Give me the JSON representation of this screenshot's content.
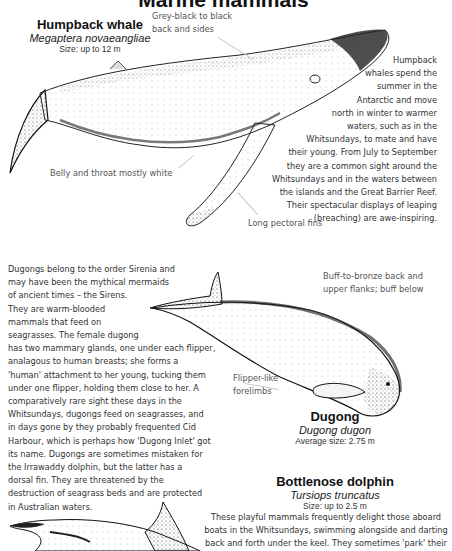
{
  "page": {
    "title": "Marine mammals"
  },
  "humpback": {
    "name": "Humpback whale",
    "scientific": "Megaptera novaeangliae",
    "size": "Size: up to 12 m",
    "labels": {
      "back": [
        "Grey-black to black",
        "back and sides"
      ],
      "belly": "Belly and throat mostly white",
      "fins": "Long pectoral fins"
    },
    "description": [
      "Humpback",
      "whales spend the",
      "summer in the",
      "Antarctic and move",
      "north in winter to warmer",
      "waters, such as in the",
      "Whitsundays, to mate and have",
      "their young. From July to September",
      "they are a common sight around the",
      "Whitsundays and in the waters between",
      "the islands and the Great Barrier Reef.",
      "Their spectacular displays of leaping",
      "(breaching) are awe-inspiring."
    ]
  },
  "dugong": {
    "name": "Dugong",
    "scientific": "Dugong dugon",
    "size": "Average size: 2.75 m",
    "labels": {
      "back": [
        "Buff-to-bronze back and",
        "upper flanks; buff below"
      ],
      "forelimbs": [
        "Flipper-like",
        "forelimbs"
      ]
    },
    "description": [
      "Dugongs belong to the order Sirenia and",
      "may have been the mythical mermaids",
      "of ancient times – the Sirens.",
      "They are warm-blooded",
      "mammals that feed on",
      "seagrasses. The female dugong",
      "has two mammary glands, one under each flipper,",
      "analagous to human breasts; she forms a",
      "'human' attachment to her young, tucking them",
      "under one flipper, holding them close to her. A",
      "comparatively rare sight these days in the",
      "Whitsundays, dugongs feed on seagrasses, and",
      "in days gone by they probably frequented Cid",
      "Harbour, which is perhaps how 'Dugong Inlet' got",
      "its name. Dugongs are sometimes mistaken for",
      "the Irrawaddy dolphin, but the latter has a",
      "dorsal fin. They are threatened by the",
      "destruction of seagrass beds and are protected",
      "in Australian waters."
    ]
  },
  "dolphin": {
    "name": "Bottlenose dolphin",
    "scientific": "Tursiops truncatus",
    "size": "Size: up to 2.5 m",
    "description": [
      "These playful mammals frequently delight those aboard",
      "boats in the Whitsundays, swimming alongside and darting",
      "back and forth under the keel. They sometimes 'park' their"
    ]
  }
}
